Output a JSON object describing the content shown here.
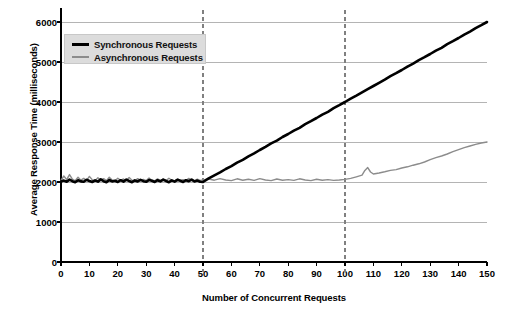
{
  "chart_data": {
    "type": "line",
    "title": "",
    "xlabel": "Number of Concurrent Requests",
    "ylabel": "Average Response Time (milliseconds)",
    "xlim": [
      0,
      150
    ],
    "ylim": [
      0,
      6000
    ],
    "xticks": [
      0,
      10,
      20,
      30,
      40,
      50,
      60,
      70,
      80,
      90,
      100,
      110,
      120,
      130,
      140,
      150
    ],
    "yticks": [
      0,
      1000,
      2000,
      3000,
      4000,
      5000,
      6000
    ],
    "grid": "horizontal",
    "legend_position": "upper-left-inside",
    "annotations": [
      {
        "type": "vline",
        "x": 50,
        "style": "dashed",
        "color": "#808080"
      },
      {
        "type": "vline",
        "x": 100,
        "style": "dashed",
        "color": "#808080"
      }
    ],
    "series": [
      {
        "name": "Synchronous Requests",
        "color": "#000000",
        "width": 2.6,
        "x": [
          0,
          1,
          2,
          3,
          4,
          5,
          6,
          7,
          8,
          9,
          10,
          11,
          12,
          13,
          14,
          15,
          16,
          17,
          18,
          19,
          20,
          21,
          22,
          23,
          24,
          25,
          26,
          27,
          28,
          29,
          30,
          31,
          32,
          33,
          34,
          35,
          36,
          37,
          38,
          39,
          40,
          41,
          42,
          43,
          44,
          45,
          46,
          47,
          48,
          49,
          50,
          52,
          54,
          56,
          58,
          60,
          62,
          64,
          66,
          68,
          70,
          72,
          74,
          76,
          78,
          80,
          82,
          84,
          86,
          88,
          90,
          92,
          94,
          96,
          98,
          100,
          102,
          104,
          106,
          108,
          110,
          112,
          114,
          116,
          118,
          120,
          122,
          124,
          126,
          128,
          130,
          132,
          134,
          136,
          138,
          140,
          142,
          144,
          146,
          148,
          150
        ],
        "y": [
          2010,
          2035,
          2005,
          2060,
          2020,
          1995,
          2045,
          2015,
          2005,
          2055,
          2025,
          2000,
          2040,
          2010,
          2065,
          2020,
          1995,
          2050,
          2015,
          2030,
          2000,
          2045,
          2010,
          2060,
          2025,
          1995,
          2040,
          2015,
          2055,
          2020,
          2005,
          2050,
          2030,
          2000,
          2045,
          2015,
          2060,
          2025,
          1995,
          2040,
          2010,
          2055,
          2030,
          2000,
          2045,
          2020,
          2060,
          2015,
          2035,
          2005,
          2000,
          2090,
          2165,
          2240,
          2325,
          2395,
          2485,
          2555,
          2640,
          2715,
          2800,
          2880,
          2965,
          3035,
          3125,
          3200,
          3285,
          3355,
          3445,
          3520,
          3600,
          3685,
          3755,
          3845,
          3920,
          4000,
          4085,
          4160,
          4240,
          4320,
          4400,
          4480,
          4560,
          4645,
          4720,
          4800,
          4885,
          4960,
          5045,
          5120,
          5200,
          5285,
          5355,
          5445,
          5520,
          5600,
          5685,
          5760,
          5845,
          5920,
          6000
        ]
      },
      {
        "name": "Asynchronous Requests",
        "color": "#8c8c8c",
        "width": 1.4,
        "x": [
          0,
          1,
          2,
          3,
          4,
          5,
          6,
          7,
          8,
          9,
          10,
          11,
          12,
          13,
          14,
          15,
          16,
          17,
          18,
          19,
          20,
          21,
          22,
          23,
          24,
          25,
          26,
          27,
          28,
          29,
          30,
          31,
          32,
          33,
          34,
          35,
          36,
          37,
          38,
          39,
          40,
          41,
          42,
          43,
          44,
          45,
          46,
          47,
          48,
          49,
          50,
          52,
          54,
          56,
          58,
          60,
          62,
          64,
          66,
          68,
          70,
          72,
          74,
          76,
          78,
          80,
          82,
          84,
          86,
          88,
          90,
          92,
          94,
          96,
          98,
          100,
          102,
          104,
          106,
          107,
          108,
          109,
          110,
          112,
          114,
          116,
          118,
          120,
          122,
          124,
          126,
          128,
          130,
          132,
          134,
          136,
          138,
          140,
          142,
          144,
          146,
          148,
          150
        ],
        "y": [
          2040,
          2150,
          2060,
          2185,
          2070,
          2030,
          2120,
          2045,
          2090,
          2035,
          2140,
          2055,
          2030,
          2105,
          2045,
          2085,
          2035,
          2120,
          2050,
          2030,
          2095,
          2040,
          2075,
          2035,
          2110,
          2045,
          2030,
          2085,
          2040,
          2065,
          2035,
          2100,
          2045,
          2030,
          2080,
          2040,
          2070,
          2035,
          2095,
          2045,
          2030,
          2075,
          2040,
          2060,
          2035,
          2090,
          2045,
          2030,
          2070,
          2040,
          2050,
          2075,
          2045,
          2085,
          2050,
          2035,
          2080,
          2045,
          2070,
          2040,
          2085,
          2050,
          2035,
          2075,
          2045,
          2060,
          2040,
          2080,
          2050,
          2035,
          2070,
          2045,
          2060,
          2040,
          2050,
          2065,
          2090,
          2130,
          2170,
          2290,
          2360,
          2250,
          2200,
          2225,
          2255,
          2290,
          2310,
          2350,
          2380,
          2420,
          2455,
          2500,
          2560,
          2610,
          2650,
          2700,
          2760,
          2810,
          2860,
          2900,
          2940,
          2975,
          3000
        ]
      }
    ]
  }
}
